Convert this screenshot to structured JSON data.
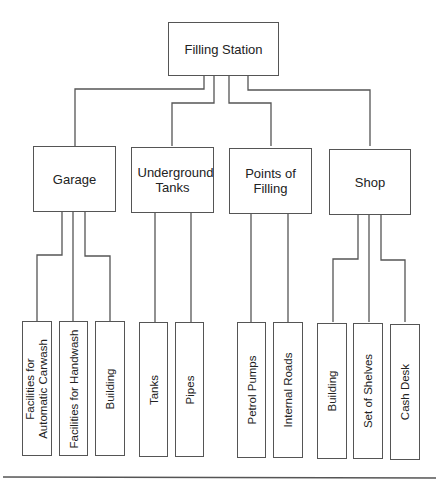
{
  "diagram": {
    "type": "hierarchy-tree",
    "root": {
      "label": "Filling Station"
    },
    "categories": [
      {
        "label": "Garage",
        "children": [
          {
            "label": "Facilities for Automatic Carwash"
          },
          {
            "label": "Facilities for Handwash"
          },
          {
            "label": "Building"
          }
        ]
      },
      {
        "label": "Underground Tanks",
        "children": [
          {
            "label": "Tanks"
          },
          {
            "label": "Pipes"
          }
        ]
      },
      {
        "label": "Points of Filling",
        "children": [
          {
            "label": "Petrol Pumps"
          },
          {
            "label": "Internal Roads"
          }
        ]
      },
      {
        "label": "Shop",
        "children": [
          {
            "label": "Building"
          },
          {
            "label": "Set of Shelves"
          },
          {
            "label": "Cash Desk"
          }
        ]
      }
    ],
    "colors": {
      "line": "#555555",
      "text": "#222222",
      "background": "#ffffff"
    }
  }
}
